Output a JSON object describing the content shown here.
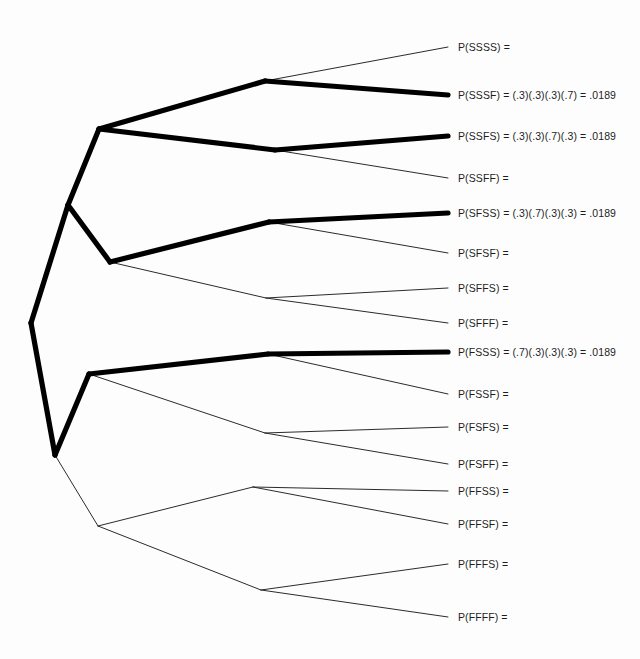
{
  "diagram": {
    "type": "probability-tree",
    "probabilities": {
      "success": ".3",
      "failure": ".7"
    },
    "stages": 4,
    "colors": {
      "background": "#fdfdfd",
      "branch": "#2b2b2b",
      "branch_highlight": "#000000",
      "text": "#1d1d1d"
    },
    "nodes": {
      "root": {
        "x": 31,
        "y": 323
      },
      "S": {
        "x": 68,
        "y": 205
      },
      "F": {
        "x": 55,
        "y": 455
      },
      "SS": {
        "x": 99,
        "y": 129
      },
      "SF": {
        "x": 110,
        "y": 262
      },
      "FS": {
        "x": 89,
        "y": 374
      },
      "FF": {
        "x": 98,
        "y": 526
      },
      "SSS": {
        "x": 265,
        "y": 81
      },
      "SSF": {
        "x": 275,
        "y": 150
      },
      "SFS": {
        "x": 269,
        "y": 222
      },
      "SFF": {
        "x": 266,
        "y": 298
      },
      "FSS": {
        "x": 268,
        "y": 354
      },
      "FSF": {
        "x": 265,
        "y": 433
      },
      "FFS": {
        "x": 253,
        "y": 487
      },
      "FFF": {
        "x": 261,
        "y": 590
      }
    },
    "leaves": [
      {
        "key": "SSSS",
        "label": "P(SSSS) =",
        "x": 458,
        "y": 47,
        "highlighted": false,
        "parent": "SSS",
        "expression": "",
        "value": ""
      },
      {
        "key": "SSSF",
        "label": "P(SSSF) = (.3)(.3)(.3)(.7) = .0189",
        "x": 458,
        "y": 95,
        "highlighted": true,
        "parent": "SSS",
        "expression": "(.3)(.3)(.3)(.7)",
        "value": ".0189"
      },
      {
        "key": "SSFS",
        "label": "P(SSFS) = (.3)(.3)(.7)(.3) = .0189",
        "x": 458,
        "y": 136,
        "highlighted": true,
        "parent": "SSF",
        "expression": "(.3)(.3)(.7)(.3)",
        "value": ".0189"
      },
      {
        "key": "SSFF",
        "label": "P(SSFF) =",
        "x": 458,
        "y": 178,
        "highlighted": false,
        "parent": "SSF",
        "expression": "",
        "value": ""
      },
      {
        "key": "SFSS",
        "label": "P(SFSS) = (.3)(.7)(.3)(.3) = .0189",
        "x": 458,
        "y": 213,
        "highlighted": true,
        "parent": "SFS",
        "expression": "(.3)(.7)(.3)(.3)",
        "value": ".0189"
      },
      {
        "key": "SFSF",
        "label": "P(SFSF) =",
        "x": 458,
        "y": 253,
        "highlighted": false,
        "parent": "SFS",
        "expression": "",
        "value": ""
      },
      {
        "key": "SFFS",
        "label": "P(SFFS) =",
        "x": 458,
        "y": 288,
        "highlighted": false,
        "parent": "SFF",
        "expression": "",
        "value": ""
      },
      {
        "key": "SFFF",
        "label": "P(SFFF) =",
        "x": 458,
        "y": 323,
        "highlighted": false,
        "parent": "SFF",
        "expression": "",
        "value": ""
      },
      {
        "key": "FSSS",
        "label": "P(FSSS) = (.7)(.3)(.3)(.3) = .0189",
        "x": 458,
        "y": 352,
        "highlighted": true,
        "parent": "FSS",
        "expression": "(.7)(.3)(.3)(.3)",
        "value": ".0189"
      },
      {
        "key": "FSSF",
        "label": "P(FSSF) =",
        "x": 458,
        "y": 394,
        "highlighted": false,
        "parent": "FSS",
        "expression": "",
        "value": ""
      },
      {
        "key": "FSFS",
        "label": "P(FSFS) =",
        "x": 458,
        "y": 427,
        "highlighted": false,
        "parent": "FSF",
        "expression": "",
        "value": ""
      },
      {
        "key": "FSFF",
        "label": "P(FSFF) =",
        "x": 458,
        "y": 464,
        "highlighted": false,
        "parent": "FSF",
        "expression": "",
        "value": ""
      },
      {
        "key": "FFSS",
        "label": "P(FFSS) =",
        "x": 458,
        "y": 491,
        "highlighted": false,
        "parent": "FFS",
        "expression": "",
        "value": ""
      },
      {
        "key": "FFSF",
        "label": "P(FFSF) =",
        "x": 458,
        "y": 524,
        "highlighted": false,
        "parent": "FFS",
        "expression": "",
        "value": ""
      },
      {
        "key": "FFFS",
        "label": "P(FFFS) =",
        "x": 458,
        "y": 564,
        "highlighted": false,
        "parent": "FFF",
        "expression": "",
        "value": ""
      },
      {
        "key": "FFFF",
        "label": "P(FFFF) =",
        "x": 458,
        "y": 617,
        "highlighted": false,
        "parent": "FFF",
        "expression": "",
        "value": ""
      }
    ],
    "edges": [
      {
        "from": "root",
        "to": "S",
        "highlighted": true
      },
      {
        "from": "root",
        "to": "F",
        "highlighted": true
      },
      {
        "from": "S",
        "to": "SS",
        "highlighted": true
      },
      {
        "from": "S",
        "to": "SF",
        "highlighted": true
      },
      {
        "from": "F",
        "to": "FS",
        "highlighted": true
      },
      {
        "from": "F",
        "to": "FF",
        "highlighted": false
      },
      {
        "from": "SS",
        "to": "SSS",
        "highlighted": true
      },
      {
        "from": "SS",
        "to": "SSF",
        "highlighted": true
      },
      {
        "from": "SF",
        "to": "SFS",
        "highlighted": true
      },
      {
        "from": "SF",
        "to": "SFF",
        "highlighted": false
      },
      {
        "from": "FS",
        "to": "FSS",
        "highlighted": true
      },
      {
        "from": "FS",
        "to": "FSF",
        "highlighted": false
      },
      {
        "from": "FF",
        "to": "FFS",
        "highlighted": false
      },
      {
        "from": "FF",
        "to": "FFF",
        "highlighted": false
      },
      {
        "from": "SSS",
        "to": "SSSS",
        "highlighted": false
      },
      {
        "from": "SSS",
        "to": "SSSF",
        "highlighted": true
      },
      {
        "from": "SSF",
        "to": "SSFS",
        "highlighted": true
      },
      {
        "from": "SSF",
        "to": "SSFF",
        "highlighted": false
      },
      {
        "from": "SFS",
        "to": "SFSS",
        "highlighted": true
      },
      {
        "from": "SFS",
        "to": "SFSF",
        "highlighted": false
      },
      {
        "from": "SFF",
        "to": "SFFS",
        "highlighted": false
      },
      {
        "from": "SFF",
        "to": "SFFF",
        "highlighted": false
      },
      {
        "from": "FSS",
        "to": "FSSS",
        "highlighted": true
      },
      {
        "from": "FSS",
        "to": "FSSF",
        "highlighted": false
      },
      {
        "from": "FSF",
        "to": "FSFS",
        "highlighted": false
      },
      {
        "from": "FSF",
        "to": "FSFF",
        "highlighted": false
      },
      {
        "from": "FFS",
        "to": "FFSS",
        "highlighted": false
      },
      {
        "from": "FFS",
        "to": "FFSF",
        "highlighted": false
      },
      {
        "from": "FFF",
        "to": "FFFS",
        "highlighted": false
      },
      {
        "from": "FFF",
        "to": "FFFF",
        "highlighted": false
      }
    ]
  }
}
